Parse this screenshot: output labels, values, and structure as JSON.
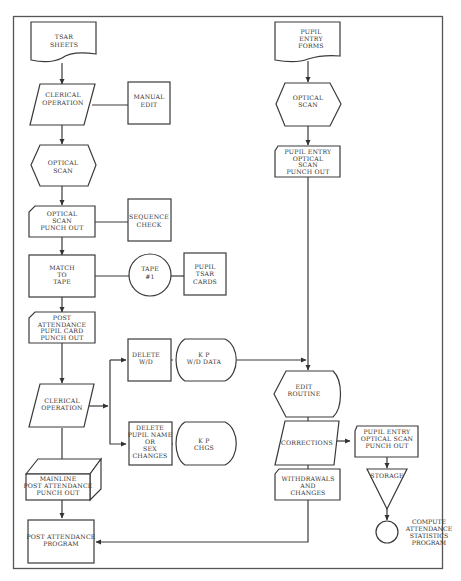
{
  "diagram": {
    "type": "flowchart",
    "nodes": {
      "tsar_sheets": {
        "shape": "document",
        "lines": [
          "TSAR",
          "SHEETS"
        ]
      },
      "clerical_op_1": {
        "shape": "parallelogram",
        "lines": [
          "CLERICAL",
          "OPERATION"
        ]
      },
      "manual_edit": {
        "shape": "rectangle",
        "lines": [
          "MANUAL",
          "EDIT"
        ]
      },
      "optical_scan_1": {
        "shape": "hexagon",
        "lines": [
          "OPTICAL",
          "SCAN"
        ]
      },
      "optical_scan_punch": {
        "shape": "card",
        "lines": [
          "OPTICAL",
          "SCAN",
          "PUNCH OUT"
        ]
      },
      "sequence_check": {
        "shape": "rectangle",
        "lines": [
          "SEQUENCE",
          "CHECK"
        ]
      },
      "match_to_tape": {
        "shape": "rectangle",
        "lines": [
          "MATCH",
          "TO",
          "TAPE"
        ]
      },
      "tape_1": {
        "shape": "circle",
        "lines": [
          "TAPE",
          "#1"
        ]
      },
      "pupil_tsar_cards": {
        "shape": "rectangle",
        "lines": [
          "PUPIL",
          "TSAR",
          "CARDS"
        ]
      },
      "post_att_card": {
        "shape": "card",
        "lines": [
          "POST",
          "ATTENDANCE",
          "PUPIL CARD",
          "PUNCH OUT"
        ]
      },
      "clerical_op_2": {
        "shape": "parallelogram",
        "lines": [
          "CLERICAL",
          "OPERATION"
        ]
      },
      "delete_wd": {
        "shape": "rectangle",
        "lines": [
          "DELETE",
          "W/D"
        ]
      },
      "kp_wd_data": {
        "shape": "display",
        "lines": [
          "K P",
          "W/D DATA"
        ]
      },
      "delete_pupil_name": {
        "shape": "rectangle",
        "lines": [
          "DELETE",
          "PUPIL NAME",
          "OR",
          "SEX",
          "CHANGES"
        ]
      },
      "kp_chgs": {
        "shape": "display",
        "lines": [
          "K P",
          "CHGS"
        ]
      },
      "mainline_post": {
        "shape": "box3d",
        "lines": [
          "MAINLINE",
          "POST ATTENDANCE",
          "PUNCH OUT"
        ]
      },
      "post_att_program": {
        "shape": "rectangle",
        "lines": [
          "POST ATTENDANCE",
          "PROGRAM"
        ]
      },
      "pupil_entry_forms": {
        "shape": "document",
        "lines": [
          "PUPIL",
          "ENTRY",
          "FORMS"
        ]
      },
      "optical_scan_2": {
        "shape": "hexagon",
        "lines": [
          "OPTICAL",
          "SCAN"
        ]
      },
      "pupil_entry_punch_1": {
        "shape": "card",
        "lines": [
          "PUPIL ENTRY",
          "OPTICAL",
          "SCAN",
          "PUNCH OUT"
        ]
      },
      "edit_routine": {
        "shape": "display",
        "lines": [
          "EDIT",
          "ROUTINE"
        ]
      },
      "corrections": {
        "shape": "parallelogram",
        "lines": [
          "CORRECTIONS"
        ]
      },
      "withdrawals": {
        "shape": "card",
        "lines": [
          "WITHDRAWALS",
          "AND",
          "CHANGES"
        ]
      },
      "pupil_entry_punch_2": {
        "shape": "card",
        "lines": [
          "PUPIL ENTRY",
          "OPTICAL SCAN",
          "PUNCH OUT"
        ]
      },
      "storage": {
        "shape": "triangle",
        "lines": [
          "STORAGE"
        ]
      },
      "compute_stats": {
        "shape": "connector",
        "lines": [
          "COMPUTE",
          "ATTENDANCE",
          "STATISTICS",
          "PROGRAM"
        ]
      }
    },
    "edges": [
      [
        "tsar_sheets",
        "clerical_op_1"
      ],
      [
        "clerical_op_1",
        "manual_edit"
      ],
      [
        "clerical_op_1",
        "optical_scan_1"
      ],
      [
        "optical_scan_1",
        "optical_scan_punch"
      ],
      [
        "optical_scan_punch",
        "sequence_check"
      ],
      [
        "optical_scan_punch",
        "match_to_tape"
      ],
      [
        "match_to_tape",
        "tape_1"
      ],
      [
        "tape_1",
        "pupil_tsar_cards"
      ],
      [
        "match_to_tape",
        "post_att_card"
      ],
      [
        "post_att_card",
        "clerical_op_2"
      ],
      [
        "clerical_op_2",
        "delete_wd"
      ],
      [
        "clerical_op_2",
        "delete_pupil_name"
      ],
      [
        "delete_wd",
        "kp_wd_data"
      ],
      [
        "delete_pupil_name",
        "kp_chgs"
      ],
      [
        "kp_wd_data",
        "edit_routine"
      ],
      [
        "clerical_op_2",
        "mainline_post"
      ],
      [
        "mainline_post",
        "post_att_program"
      ],
      [
        "pupil_entry_forms",
        "optical_scan_2"
      ],
      [
        "optical_scan_2",
        "pupil_entry_punch_1"
      ],
      [
        "pupil_entry_punch_1",
        "edit_routine"
      ],
      [
        "edit_routine",
        "corrections"
      ],
      [
        "corrections",
        "withdrawals"
      ],
      [
        "corrections",
        "pupil_entry_punch_2"
      ],
      [
        "pupil_entry_punch_2",
        "storage"
      ],
      [
        "storage",
        "compute_stats"
      ],
      [
        "withdrawals",
        "post_att_program"
      ]
    ]
  }
}
